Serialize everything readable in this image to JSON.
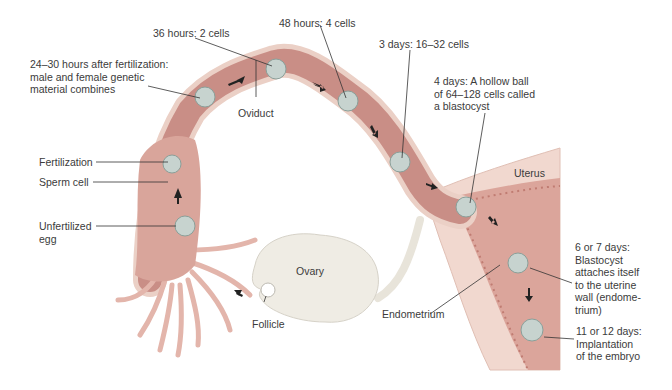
{
  "figure": {
    "colors": {
      "tube_wall": "#e9c9bf",
      "tube_lumen": "#c98e86",
      "uterus_outer": "#f1d8cf",
      "uterus_cavity": "#dba59b",
      "ovary": "#efece4",
      "cell": "#c7d3cf",
      "arrow": "#222222",
      "leader": "#333333"
    }
  },
  "labels": {
    "stage_24_30h": [
      "24–30 hours after fertilization:",
      "male and female genetic",
      "material combines"
    ],
    "stage_36h": "36 hours: 2 cells",
    "stage_48h": "48 hours: 4 cells",
    "stage_3d": "3 days: 16–32 cells",
    "stage_4d": [
      "4 days: A hollow ball",
      "of 64–128 cells called",
      "a blastocyst"
    ],
    "oviduct": "Oviduct",
    "uterus": "Uterus",
    "fertilization": "Fertilization",
    "sperm_cell": "Sperm cell",
    "unfertilized_egg": [
      "Unfertilized",
      "egg"
    ],
    "ovary": "Ovary",
    "follicle": "Follicle",
    "endometrium": "Endometrium",
    "stage_6_7d": [
      "6 or 7 days:",
      "Blastocyst",
      "attaches itself",
      "to the uterine",
      "wall (endome-",
      "trium)"
    ],
    "stage_11_12d": [
      "11 or 12 days:",
      "Implantation",
      "of the embryo"
    ]
  }
}
